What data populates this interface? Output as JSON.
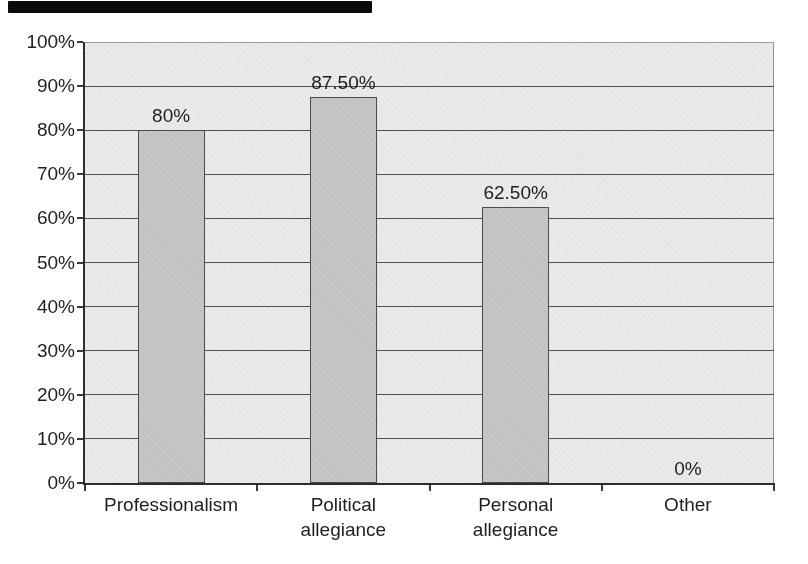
{
  "chart_data": {
    "type": "bar",
    "title": "",
    "xlabel": "",
    "ylabel": "",
    "categories": [
      "Professionalism",
      "Political allegiance",
      "Personal allegiance",
      "Other"
    ],
    "values": [
      80,
      87.5,
      62.5,
      0
    ],
    "data_labels": [
      "80%",
      "87.50%",
      "62.50%",
      "0%"
    ],
    "category_label_lines": [
      [
        "Professionalism"
      ],
      [
        "Political",
        "allegiance"
      ],
      [
        "Personal",
        "allegiance"
      ],
      [
        "Other"
      ]
    ],
    "y_tick_labels": [
      "100%",
      "90%",
      "80%",
      "70%",
      "60%",
      "50%",
      "40%",
      "30%",
      "20%",
      "10%",
      "0%"
    ],
    "ylim": [
      0,
      100
    ],
    "y_tick_step": 10,
    "grid": "horizontal",
    "legend": "none",
    "colors": {
      "page_background": "#ffffff",
      "plot_background": "#ebebeb",
      "bar_fill": "#c5c5c5",
      "bar_border": "#4a4a4a",
      "gridline": "#4f4f4f",
      "axis": "#2d2d2d",
      "tick": "#3a3a3a",
      "text": "#1e1e1e",
      "scan_artifact": "#0b0b0b"
    }
  }
}
